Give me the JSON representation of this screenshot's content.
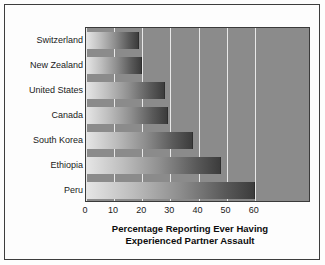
{
  "chart_data": {
    "type": "bar",
    "orientation": "horizontal",
    "title": "",
    "xlabel": "Percentage Reporting Ever Having Experienced Partner Assault",
    "xlabel_lines": [
      "Percentage Reporting Ever Having",
      "Experienced Partner Assault"
    ],
    "ylabel": "",
    "categories": [
      "Switzerland",
      "New Zealand",
      "United States",
      "Canada",
      "South Korea",
      "Ethiopia",
      "Peru"
    ],
    "values": [
      19,
      20,
      28,
      29,
      38,
      48,
      60
    ],
    "xticks": [
      0,
      10,
      20,
      30,
      40,
      50,
      60
    ],
    "xtick_labels": [
      "0",
      "10",
      "20",
      "30",
      "40",
      "50",
      "60"
    ],
    "xlim": [
      0,
      80
    ],
    "grid": "vertical-only",
    "legend": "none",
    "colors": {
      "plot_background": "#8b8b8b",
      "gridline": "#e8e8e8",
      "figure_background": "#fdfdfd",
      "frame_border": "#3d3d3d",
      "bar_gradient_start": "#e6e6e6",
      "bar_gradient_end": "#3c3c3c",
      "text": "#1a1a1a"
    }
  }
}
